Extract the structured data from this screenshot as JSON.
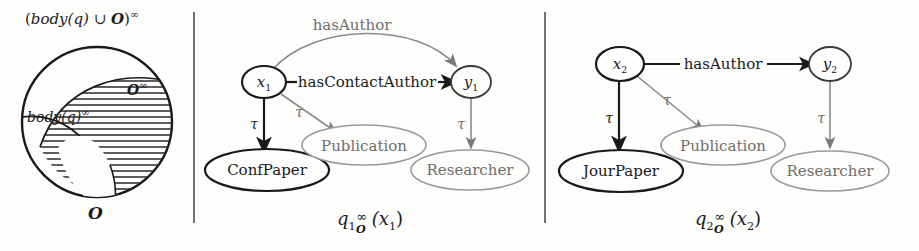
{
  "figure": {
    "panels": [
      {
        "id": "venn",
        "name": "saturation-venn-diagram",
        "labels": {
          "outer": "(body(q) ∪ O)^∞",
          "outer_parts": {
            "open": "(",
            "body": "body",
            "q": "(q)",
            "union": " ∪ ",
            "onto": "O",
            "close": ")",
            "inf": "∞"
          },
          "left_region": "body(q)^∞",
          "left_region_parts": {
            "body": "body",
            "q": "(q)",
            "inf": "∞"
          },
          "right_region": "O^∞",
          "right_region_parts": {
            "onto": "O",
            "inf": "∞"
          },
          "bottom": "O"
        }
      },
      {
        "id": "q1",
        "name": "query-graph-q1",
        "caption": "q1_O^∞(x1)",
        "caption_parts": {
          "q": "q",
          "index": "1",
          "sub": "O",
          "sup": "∞",
          "arg": "(x",
          "argsub": "1",
          "argclose": ")"
        },
        "nodes": [
          {
            "id": "x1",
            "label": "x",
            "sub": "1",
            "kind": "variable",
            "emphasis": "bold"
          },
          {
            "id": "y1",
            "label": "y",
            "sub": "1",
            "kind": "variable",
            "emphasis": "normal"
          },
          {
            "id": "confpaper",
            "label": "ConfPaper",
            "kind": "concept",
            "emphasis": "bold"
          },
          {
            "id": "publication",
            "label": "Publication",
            "kind": "concept",
            "emphasis": "dim"
          },
          {
            "id": "researcher",
            "label": "Researcher",
            "kind": "concept",
            "emphasis": "dim"
          }
        ],
        "edges": [
          {
            "id": "e-hasauthor",
            "from": "x1",
            "to": "y1",
            "label": "hasAuthor",
            "style": "curved",
            "emphasis": "dim"
          },
          {
            "id": "e-hascontactauthor",
            "from": "x1",
            "to": "y1",
            "label": "hasContactAuthor",
            "style": "straight",
            "emphasis": "bold"
          },
          {
            "id": "e-x1-confpaper",
            "from": "x1",
            "to": "confpaper",
            "label": "τ",
            "style": "straight",
            "emphasis": "bold"
          },
          {
            "id": "e-x1-publication",
            "from": "x1",
            "to": "publication",
            "label": "τ",
            "style": "straight",
            "emphasis": "dim"
          },
          {
            "id": "e-y1-researcher",
            "from": "y1",
            "to": "researcher",
            "label": "τ",
            "style": "straight",
            "emphasis": "dim"
          }
        ]
      },
      {
        "id": "q2",
        "name": "query-graph-q2",
        "caption": "q2_O^∞(x2)",
        "caption_parts": {
          "q": "q",
          "index": "2",
          "sub": "O",
          "sup": "∞",
          "arg": "(x",
          "argsub": "2",
          "argclose": ")"
        },
        "nodes": [
          {
            "id": "x2",
            "label": "x",
            "sub": "2",
            "kind": "variable",
            "emphasis": "bold"
          },
          {
            "id": "y2",
            "label": "y",
            "sub": "2",
            "kind": "variable",
            "emphasis": "normal"
          },
          {
            "id": "jourpaper",
            "label": "JourPaper",
            "kind": "concept",
            "emphasis": "bold"
          },
          {
            "id": "publication",
            "label": "Publication",
            "kind": "concept",
            "emphasis": "dim"
          },
          {
            "id": "researcher",
            "label": "Researcher",
            "kind": "concept",
            "emphasis": "dim"
          }
        ],
        "edges": [
          {
            "id": "e-hasauthor",
            "from": "x2",
            "to": "y2",
            "label": "hasAuthor",
            "style": "straight",
            "emphasis": "bold"
          },
          {
            "id": "e-x2-jourpaper",
            "from": "x2",
            "to": "jourpaper",
            "label": "τ",
            "style": "straight",
            "emphasis": "bold"
          },
          {
            "id": "e-x2-publication",
            "from": "x2",
            "to": "publication",
            "label": "τ",
            "style": "straight",
            "emphasis": "dim"
          },
          {
            "id": "e-y2-researcher",
            "from": "y2",
            "to": "researcher",
            "label": "τ",
            "style": "straight",
            "emphasis": "dim"
          }
        ]
      }
    ],
    "colors": {
      "ink": "#1a1a1a",
      "dim_ink": "#6f6f6d",
      "background": "#fdfdfc",
      "hatch": "#2a2a28"
    }
  }
}
